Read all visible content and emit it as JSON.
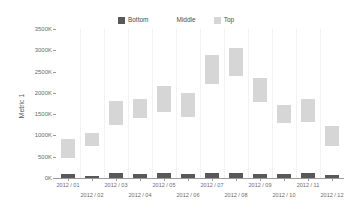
{
  "chart_data": {
    "type": "bar",
    "title": "",
    "subtitle": "",
    "xlabel": "",
    "ylabel": "Metric 1",
    "ylim": [
      0,
      3500000
    ],
    "ytick_labels": [
      "0K",
      "500K",
      "1000K",
      "1500K",
      "2000K",
      "2500K",
      "3000K",
      "3500K"
    ],
    "ytick_values": [
      0,
      500000,
      1000000,
      1500000,
      2000000,
      2500000,
      3000000,
      3500000
    ],
    "grid": false,
    "stacked": true,
    "legend_position": "top-center",
    "categories": [
      "2012 / 01",
      "2012 / 02",
      "2012 / 03",
      "2012 / 04",
      "2012 / 05",
      "2012 / 06",
      "2012 / 07",
      "2012 / 08",
      "2012 / 09",
      "2012 / 10",
      "2012 / 11",
      "2012 / 12"
    ],
    "series": [
      {
        "name": "Bottom",
        "color": "#595959",
        "values": [
          90000,
          50000,
          110000,
          100000,
          115000,
          95000,
          120000,
          125000,
          105000,
          100000,
          110000,
          70000
        ]
      },
      {
        "name": "Middle",
        "color": "#ffffff",
        "values": [
          380000,
          700000,
          1140000,
          1300000,
          1435000,
          1330000,
          2080000,
          2275000,
          1690000,
          1200000,
          1215000,
          680000
        ]
      },
      {
        "name": "Top",
        "color": "#d6d6d6",
        "values": [
          455000,
          310000,
          550000,
          450000,
          600000,
          575000,
          700000,
          650000,
          555000,
          410000,
          520000,
          480000
        ]
      }
    ],
    "series_totals": [
      925000,
      1060000,
      1800000,
      1850000,
      2150000,
      2000000,
      2900000,
      3050000,
      2350000,
      1710000,
      1845000,
      1230000
    ]
  },
  "legend": {
    "items": [
      {
        "label": "Bottom",
        "color": "#595959"
      },
      {
        "label": "Middle",
        "color": "#ffffff"
      },
      {
        "label": "Top",
        "color": "#d6d6d6"
      }
    ]
  },
  "axes": {
    "y_title": "Metric 1"
  }
}
